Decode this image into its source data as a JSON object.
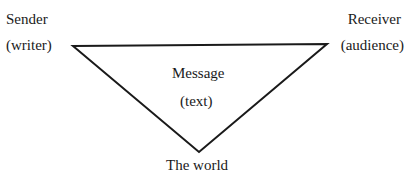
{
  "diagram": {
    "sender": {
      "line1": "Sender",
      "line2": "(writer)"
    },
    "receiver": {
      "line1": "Receiver",
      "line2": "(audience)"
    },
    "message": {
      "line1": "Message",
      "line2": "(text)"
    },
    "world": {
      "label": "The world"
    },
    "stroke_color": "#1a1a1a"
  }
}
